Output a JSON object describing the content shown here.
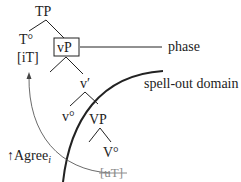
{
  "diagram": {
    "type": "syntax-tree",
    "nodes": {
      "tp": "TP",
      "t_head": "T°",
      "t_feature": "[iT]",
      "vp_phase": "vP",
      "v_bar": "v′",
      "v_head": "v°",
      "big_vp": "VP",
      "big_v_head": "V°",
      "ut_feature": "[uT]"
    },
    "annotations": {
      "phase_label": "phase",
      "spellout_label": "spell-out domain",
      "agree_label": "↑Agree",
      "agree_subscript": "i"
    },
    "colors": {
      "line": "#222222",
      "deleted_feature": "#8a8a8a"
    }
  }
}
